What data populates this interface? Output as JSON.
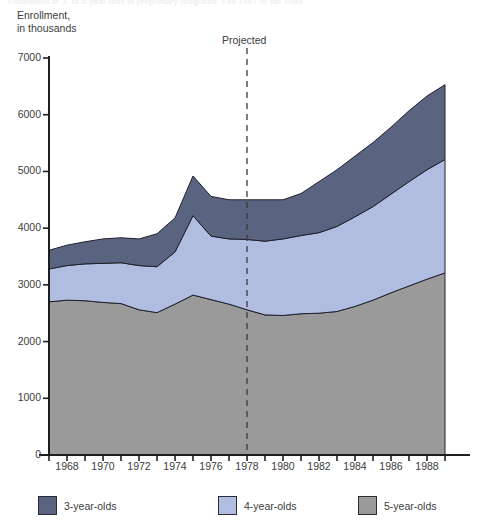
{
  "figure": {
    "clipped_top_text": "Enrollment of 3- to 5-year-olds in preprimary programs: Fall 1967 to fall 1989",
    "y_axis_title": "Enrollment,\nin thousands",
    "projected_label": "Projected",
    "projected_year": 1978
  },
  "legend": [
    {
      "label": "3-year-olds",
      "color": "#5a6480"
    },
    {
      "label": "4-year-olds",
      "color": "#b0bce0"
    },
    {
      "label": "5-year-olds",
      "color": "#9a9a9a"
    }
  ],
  "chart_data": {
    "type": "area",
    "title": "Enrollment of 3- to 5-year-olds in preprimary programs: Fall 1967 to fall 1989",
    "xlabel": "",
    "ylabel": "Enrollment, in thousands",
    "stacked": true,
    "xlim": [
      1967,
      1989
    ],
    "ylim": [
      0,
      7000
    ],
    "ytick_interval": 1000,
    "yticks": [
      0,
      1000,
      2000,
      3000,
      4000,
      5000,
      6000,
      7000
    ],
    "ytick_labels": [
      "0",
      "1000",
      "2000",
      "3000",
      "4000",
      "5000",
      "6000",
      "7000"
    ],
    "xticks": [
      1967,
      1968,
      1969,
      1970,
      1971,
      1972,
      1973,
      1974,
      1975,
      1976,
      1977,
      1978,
      1979,
      1980,
      1981,
      1982,
      1983,
      1984,
      1985,
      1986,
      1987,
      1988,
      1989
    ],
    "xtick_labels_shown": [
      "1968",
      "1970",
      "1972",
      "1974",
      "1976",
      "1978",
      "1980",
      "1982",
      "1984",
      "1986",
      "1988"
    ],
    "grid": false,
    "legend_position": "bottom",
    "annotations": [
      {
        "text": "Projected",
        "x": 1978,
        "style": "dashed-vertical-line"
      }
    ],
    "x": [
      1967,
      1968,
      1969,
      1970,
      1971,
      1972,
      1973,
      1974,
      1975,
      1976,
      1977,
      1978,
      1979,
      1980,
      1981,
      1982,
      1983,
      1984,
      1985,
      1986,
      1987,
      1988,
      1989
    ],
    "series": [
      {
        "name": "5-year-olds",
        "color": "#9a9a9a",
        "values": [
          2700,
          2730,
          2720,
          2690,
          2670,
          2560,
          2510,
          2660,
          2820,
          2740,
          2660,
          2560,
          2470,
          2460,
          2490,
          2500,
          2530,
          2620,
          2730,
          2860,
          2980,
          3100,
          3210
        ]
      },
      {
        "name": "4-year-olds",
        "color": "#b0bce0",
        "values": [
          580,
          610,
          650,
          690,
          720,
          780,
          810,
          920,
          1400,
          1120,
          1150,
          1240,
          1300,
          1350,
          1380,
          1420,
          1500,
          1580,
          1650,
          1740,
          1840,
          1930,
          2000
        ]
      },
      {
        "name": "3-year-olds",
        "color": "#5a6480",
        "values": [
          330,
          360,
          390,
          430,
          440,
          470,
          580,
          600,
          700,
          700,
          690,
          700,
          730,
          690,
          740,
          900,
          1000,
          1070,
          1130,
          1180,
          1250,
          1300,
          1320
        ]
      }
    ],
    "stack_totals": [
      3610,
      3700,
      3760,
      3810,
      3830,
      3810,
      3900,
      4180,
      4920,
      4560,
      4500,
      4500,
      4500,
      4500,
      4610,
      4820,
      5030,
      5270,
      5510,
      5780,
      6070,
      6330,
      6530
    ]
  }
}
